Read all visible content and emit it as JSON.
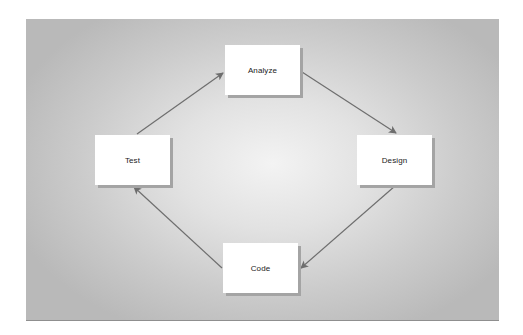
{
  "diagram": {
    "type": "cycle",
    "nodes": [
      {
        "id": "analyze",
        "label": "Analyze"
      },
      {
        "id": "design",
        "label": "Design"
      },
      {
        "id": "code",
        "label": "Code"
      },
      {
        "id": "test",
        "label": "Test"
      }
    ],
    "edges": [
      {
        "from": "test",
        "to": "analyze"
      },
      {
        "from": "analyze",
        "to": "design"
      },
      {
        "from": "design",
        "to": "code"
      },
      {
        "from": "code",
        "to": "test"
      }
    ],
    "colors": {
      "arrow": "#6e6e6e",
      "node_fill": "#ffffff",
      "node_shadow": "#a4a4a4",
      "background_center": "#f3f3f3",
      "background_edge": "#b9b9b9"
    }
  }
}
